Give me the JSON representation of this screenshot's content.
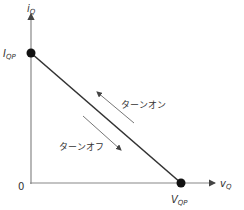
{
  "diagram": {
    "type": "switching-trajectory",
    "y_axis": {
      "label": "i",
      "subscript": "Q"
    },
    "x_axis": {
      "label": "v",
      "subscript": "Q"
    },
    "origin_label": "0",
    "points": [
      {
        "label": "I",
        "subscript": "QP",
        "x": 0,
        "y": "I_QP"
      },
      {
        "label": "V",
        "subscript": "QP",
        "x": "V_QP",
        "y": 0
      }
    ],
    "annotations": [
      {
        "text": "ターンオン",
        "direction": "toward I_QP"
      },
      {
        "text": "ターンオフ",
        "direction": "toward V_QP"
      }
    ],
    "colors": {
      "axis": "#888888",
      "line": "#333333",
      "dot": "#111111",
      "arrow": "#777777"
    }
  }
}
